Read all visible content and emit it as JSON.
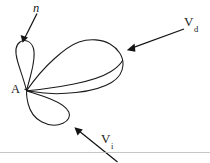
{
  "figure": {
    "background_color": "#ffffff",
    "stroke_color": "#1a1a1a",
    "width": 210,
    "height": 163,
    "labels": {
      "apex": "A",
      "normal": "n",
      "v_direct_main": "V",
      "v_direct_sub": "d",
      "v_indirect_main": "V",
      "v_indirect_sub": "i"
    },
    "annotations": [
      {
        "name": "normal-vector",
        "label": "n",
        "style": "italic",
        "label_x": 33,
        "label_y": 3,
        "arrow_from": [
          37,
          13
        ],
        "arrow_to": [
          23,
          41
        ],
        "points_at": "upper-lobe-tip"
      },
      {
        "name": "direct-velocity",
        "label": "V_d",
        "label_x": 184,
        "label_y": 16,
        "arrow_from": [
          184,
          29
        ],
        "arrow_to": [
          127,
          50
        ],
        "points_at": "large-right-lobe"
      },
      {
        "name": "indirect-velocity",
        "label": "V_i",
        "label_x": 101,
        "label_y": 133,
        "arrow_from": [
          117,
          162
        ],
        "arrow_to": [
          74,
          127
        ],
        "points_at": "lower-lobe"
      }
    ],
    "apex_point": [
      26,
      90
    ],
    "lobes": [
      {
        "name": "upper-lobe",
        "description": "narrow teardrop rising from apex, tip near top-left",
        "extent": [
          13,
          40,
          48,
          92
        ]
      },
      {
        "name": "large-right-lobe",
        "description": "wide rounded lobe extending right from apex",
        "extent": [
          26,
          38,
          124,
          96
        ]
      },
      {
        "name": "lower-lobe",
        "description": "small lobe descending right-down from apex",
        "extent": [
          26,
          88,
          70,
          126
        ]
      }
    ],
    "bottom_rule": {
      "name": "bottom-rule",
      "y": 152,
      "color": "#b9b9b9"
    }
  }
}
